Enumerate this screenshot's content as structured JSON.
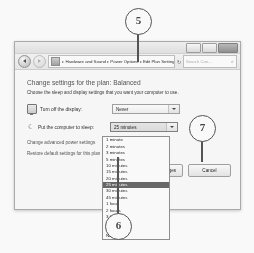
{
  "callouts": [
    {
      "number": "5"
    },
    {
      "number": "6"
    },
    {
      "number": "7"
    }
  ],
  "window": {
    "titlebar": {
      "minimize_label": "Minimize",
      "maximize_label": "Maximize",
      "close_label": "Close"
    },
    "address_bar": {
      "back_label": "Back",
      "forward_label": "Forward",
      "breadcrumbs": [
        "Hardware and Sound",
        "Power Options",
        "Edit Plan Settings"
      ],
      "separator": "▸",
      "dropdown_caret": "▾",
      "refresh_icon": "↻",
      "search_placeholder": "Search Con...",
      "search_icon": "⌕"
    },
    "content": {
      "title": "Change settings for the plan: Balanced",
      "subtitle": "Choose the sleep and display settings that you want your computer to use.",
      "settings": [
        {
          "label": "Turn off the display:",
          "value": "Never",
          "icon": "monitor-icon"
        },
        {
          "label": "Put the computer to sleep:",
          "value": "25 minutes",
          "icon": "moon-icon"
        }
      ],
      "links": [
        "Change advanced power settings",
        "Restore default settings for this plan"
      ],
      "dropdown": {
        "selected": "25 minutes",
        "options": [
          "1 minute",
          "2 minutes",
          "3 minutes",
          "5 minutes",
          "10 minutes",
          "15 minutes",
          "20 minutes",
          "25 minutes",
          "30 minutes",
          "45 minutes",
          "1 hour",
          "2 hours",
          "3 hours",
          "4 hours",
          "5 hours",
          "Never"
        ]
      },
      "buttons": {
        "save": "Save changes",
        "cancel": "Cancel"
      }
    }
  }
}
